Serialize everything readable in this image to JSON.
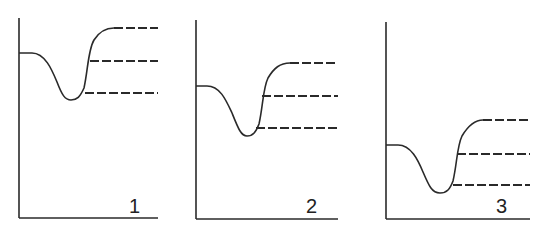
{
  "figure": {
    "line_color": "#2a2a2a",
    "panels": [
      {
        "label": "1"
      },
      {
        "label": "2"
      },
      {
        "label": "3"
      }
    ]
  }
}
